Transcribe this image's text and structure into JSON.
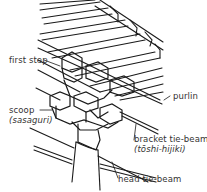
{
  "diagram": {
    "labels": {
      "first_step": "first step",
      "purlin": "purlin",
      "scoop": "scoop",
      "scoop_jp": "(sasaguri)",
      "bracket_tie_beam": "bracket tie-beam",
      "bracket_tie_beam_jp": "(tōshi-hijiki)",
      "head_tie_beam": "head tie-beam"
    },
    "colors": {
      "line": "#1a1a1a",
      "text": "#333333",
      "background": "#ffffff"
    }
  }
}
